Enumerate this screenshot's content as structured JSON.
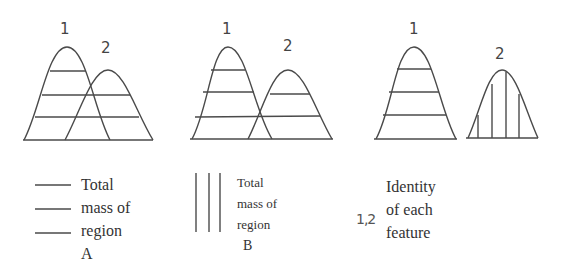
{
  "panels": [
    {
      "id": "panel-overlap-horizontal",
      "peak_labels": [
        "1",
        "2"
      ],
      "hatching": {
        "peak1": "horizontal",
        "peak2": "horizontal"
      }
    },
    {
      "id": "panel-touching-horizontal",
      "peak_labels": [
        "1",
        "2"
      ],
      "hatching": {
        "peak1": "horizontal",
        "peak2": "horizontal"
      }
    },
    {
      "id": "panel-separated-mixed",
      "peak_labels": [
        "1",
        "2"
      ],
      "hatching": {
        "peak1": "horizontal",
        "peak2": "vertical"
      }
    }
  ],
  "legend": {
    "a": {
      "line1": "Total",
      "line2": "mass of",
      "line3": "region",
      "tag": "A",
      "symbol": "horizontal-lines"
    },
    "b": {
      "line1": "Total",
      "line2": "mass of",
      "line3": "region",
      "tag": "B",
      "symbol": "vertical-lines"
    },
    "c": {
      "symbol_text": "1,2",
      "line1": "Identity",
      "line2": "of each",
      "line3": "feature"
    }
  },
  "colors": {
    "stroke": "#4a4a4a",
    "background": "#ffffff"
  }
}
